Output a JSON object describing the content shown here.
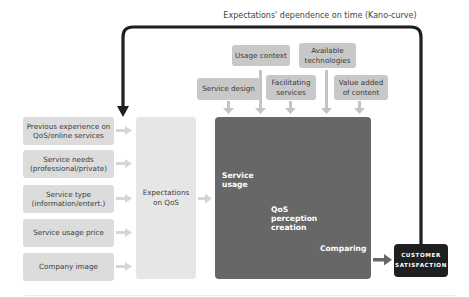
{
  "diagram": {
    "feedback_label": "Expectations' dependence on time (Kano-curve)",
    "inputs": [
      {
        "label_line1": "Previous experience on",
        "label_line2": "QoS/online services"
      },
      {
        "label_line1": "Service needs",
        "label_line2": "(professional/private)"
      },
      {
        "label_line1": "Service type",
        "label_line2": "(information/entert.)"
      },
      {
        "label_line1": "Service usage price",
        "label_line2": ""
      },
      {
        "label_line1": "Company image",
        "label_line2": ""
      }
    ],
    "expectations": {
      "line1": "Expectations",
      "line2": "on QoS"
    },
    "influences": [
      {
        "line1": "Service design",
        "line2": ""
      },
      {
        "line1": "Usage context",
        "line2": ""
      },
      {
        "line1": "Facilitating",
        "line2": "services"
      },
      {
        "line1": "Available",
        "line2": "technologies"
      },
      {
        "line1": "Value added",
        "line2": "of content"
      }
    ],
    "process": {
      "step1": {
        "line1": "Service",
        "line2": "usage"
      },
      "step2": {
        "line1": "QoS",
        "line2": "perception",
        "line3": "creation"
      },
      "step3": {
        "line1": "Comparing"
      }
    },
    "outcome": {
      "line1": "CUSTOMER",
      "line2": "SATISFACTION"
    },
    "colors": {
      "input_box": "#dcdcdc",
      "influence_box": "#c8c8c8",
      "expectations_box": "#e6e6e6",
      "process_box": "#676767",
      "outcome_box": "#1f1f1f",
      "feedback_arrow": "#1f1f1f",
      "light_arrow": "#d6d6d6"
    }
  }
}
